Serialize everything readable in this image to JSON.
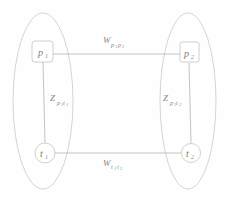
{
  "diagram": {
    "type": "graph",
    "title": "",
    "groups": [
      {
        "id": "left-group",
        "name": "left-layer-ellipse"
      },
      {
        "id": "right-group",
        "name": "right-layer-ellipse"
      }
    ],
    "nodes": [
      {
        "id": "p1",
        "label": "p",
        "subscript": "1",
        "shape": "rounded-square",
        "group": "left-group"
      },
      {
        "id": "p2",
        "label": "p",
        "subscript": "2",
        "shape": "rounded-square",
        "group": "right-group"
      },
      {
        "id": "t1",
        "label": "t",
        "subscript": "1",
        "shape": "circle",
        "group": "left-group"
      },
      {
        "id": "t2",
        "label": "t",
        "subscript": "2",
        "shape": "circle",
        "group": "right-group"
      }
    ],
    "edges": [
      {
        "id": "edge-p1-p2",
        "from": "p1",
        "to": "p2",
        "label_main": "W",
        "label_sub_1": "p",
        "label_sub_1_idx": "1",
        "label_sub_2": "p",
        "label_sub_2_idx": "2",
        "position": "top"
      },
      {
        "id": "edge-t1-t2",
        "from": "t1",
        "to": "t2",
        "label_main": "W",
        "label_sub_1": "t",
        "label_sub_1_idx": "1",
        "label_sub_2": "t",
        "label_sub_2_idx": "2",
        "position": "bottom"
      },
      {
        "id": "edge-p1-t1",
        "from": "p1",
        "to": "t1",
        "label_main": "Z",
        "label_sub_1": "p",
        "label_sub_1_idx": "1",
        "label_sub_2": "t",
        "label_sub_2_idx": "1",
        "position": "left"
      },
      {
        "id": "edge-p2-t2",
        "from": "p2",
        "to": "t2",
        "label_main": "Z",
        "label_sub_1": "p",
        "label_sub_1_idx": "2",
        "label_sub_2": "t",
        "label_sub_2_idx": "2",
        "position": "right"
      }
    ],
    "colors": {
      "background": "#fefefe",
      "stroke": "#b5b5b5",
      "ellipse_stroke": "#c9c9c9",
      "node_stroke": "#c4c4c4",
      "text": "#7d7d7d"
    }
  }
}
